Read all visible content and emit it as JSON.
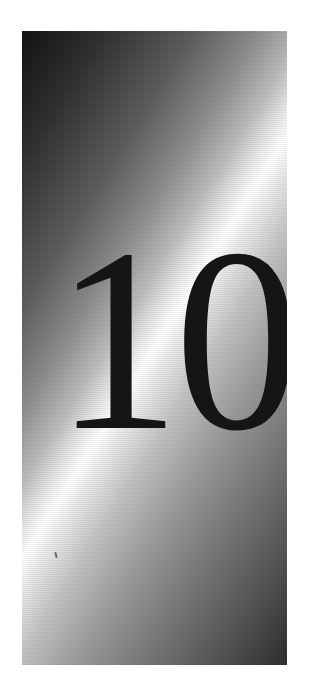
{
  "panel": {
    "chapter_number": "10",
    "style": "metallic-gradient",
    "colors": {
      "background": "#ffffff",
      "panel_dark": "#0e0e0e",
      "panel_highlight": "#ffffff",
      "numeral": "#151515"
    }
  }
}
